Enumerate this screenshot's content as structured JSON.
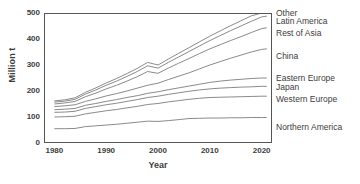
{
  "chart_data": {
    "type": "line",
    "title": "",
    "xlabel": "Year",
    "ylabel": "Million t",
    "xlim": [
      1978,
      2022
    ],
    "ylim": [
      0,
      500
    ],
    "xticks": [
      1980,
      1990,
      2000,
      2010,
      2020
    ],
    "xticklabels": [
      "1980",
      "1990",
      "2000",
      "2010",
      "2020"
    ],
    "yticks": [
      0,
      100,
      200,
      300,
      400,
      500
    ],
    "yticklabels": [
      "0",
      "100",
      "200",
      "300",
      "400",
      "500"
    ],
    "grid": false,
    "legend_position": "right-of-axes-at-line-ends",
    "stacked": true,
    "note": "Cumulative stacked line chart; each labelled line is the running total up to and including that region.",
    "x": [
      1980,
      1982,
      1984,
      1986,
      1988,
      1990,
      1992,
      1994,
      1996,
      1998,
      2000,
      2002,
      2004,
      2006,
      2008,
      2010,
      2012,
      2014,
      2016,
      2018,
      2020,
      2021
    ],
    "series": [
      {
        "name": "Northern America",
        "label": "Northern America",
        "cumulative_values": [
          55,
          55,
          56,
          63,
          66,
          69,
          72,
          76,
          80,
          84,
          83,
          86,
          90,
          94,
          95,
          96,
          96,
          97,
          97,
          98,
          98,
          98
        ]
      },
      {
        "name": "Western Europe",
        "label": "Western Europe",
        "cumulative_values": [
          100,
          101,
          103,
          112,
          118,
          124,
          129,
          135,
          141,
          148,
          152,
          158,
          163,
          168,
          172,
          175,
          176,
          177,
          178,
          179,
          180,
          180
        ]
      },
      {
        "name": "Japan",
        "label": "Japan",
        "cumulative_values": [
          118,
          119,
          122,
          133,
          140,
          147,
          153,
          160,
          167,
          175,
          180,
          187,
          193,
          199,
          204,
          208,
          211,
          213,
          215,
          216,
          218,
          218
        ]
      },
      {
        "name": "Eastern Europe",
        "label": "Eastern Europe",
        "cumulative_values": [
          128,
          130,
          133,
          145,
          152,
          160,
          167,
          175,
          182,
          191,
          197,
          205,
          212,
          219,
          226,
          233,
          238,
          242,
          245,
          248,
          250,
          250
        ]
      },
      {
        "name": "China",
        "label": "China",
        "cumulative_values": [
          140,
          143,
          147,
          160,
          170,
          181,
          190,
          200,
          211,
          222,
          230,
          244,
          257,
          270,
          285,
          300,
          313,
          326,
          338,
          350,
          360,
          362
        ]
      },
      {
        "name": "Rest of Asia",
        "label": "Rest of Asia",
        "cumulative_values": [
          150,
          154,
          160,
          178,
          192,
          208,
          222,
          238,
          255,
          275,
          268,
          288,
          307,
          325,
          344,
          362,
          378,
          394,
          409,
          425,
          440,
          443
        ]
      },
      {
        "name": "Latin America",
        "label": "Latin America",
        "cumulative_values": [
          157,
          161,
          168,
          188,
          204,
          222,
          238,
          256,
          275,
          297,
          288,
          310,
          331,
          352,
          373,
          394,
          413,
          432,
          450,
          468,
          485,
          488
        ]
      },
      {
        "name": "Other",
        "label": "Other",
        "cumulative_values": [
          162,
          166,
          174,
          195,
          212,
          231,
          248,
          267,
          287,
          310,
          300,
          323,
          345,
          367,
          389,
          411,
          431,
          451,
          470,
          489,
          500,
          503
        ]
      }
    ],
    "label_y_positions": {
      "Other": 500,
      "Latin America": 470,
      "Rest of Asia": 425,
      "China": 335,
      "Eastern Europe": 250,
      "Japan": 215,
      "Western Europe": 170,
      "Northern America": 60
    },
    "colors": {
      "line": "#7d7d7d",
      "axis": "#555555",
      "text": "#3d3d3d",
      "background": "#ffffff"
    }
  }
}
